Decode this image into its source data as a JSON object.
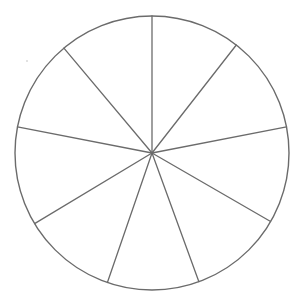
{
  "diagram": {
    "type": "divided-circle",
    "slice_count": 9,
    "center": [
      152,
      153
    ],
    "radius": 137,
    "line_color": "#6b6b6b",
    "background": "#ffffff",
    "spoke_angles_deg": [
      0,
      38,
      79,
      120,
      160,
      199,
      239,
      281,
      320
    ],
    "slices": [
      {
        "label": "",
        "start_deg": 0,
        "end_deg": 38
      },
      {
        "label": "",
        "start_deg": 38,
        "end_deg": 79
      },
      {
        "label": "",
        "start_deg": 79,
        "end_deg": 120
      },
      {
        "label": "",
        "start_deg": 120,
        "end_deg": 160
      },
      {
        "label": "",
        "start_deg": 160,
        "end_deg": 199
      },
      {
        "label": "",
        "start_deg": 199,
        "end_deg": 239
      },
      {
        "label": "",
        "start_deg": 239,
        "end_deg": 281
      },
      {
        "label": "",
        "start_deg": 281,
        "end_deg": 320
      },
      {
        "label": "",
        "start_deg": 320,
        "end_deg": 360
      }
    ]
  }
}
